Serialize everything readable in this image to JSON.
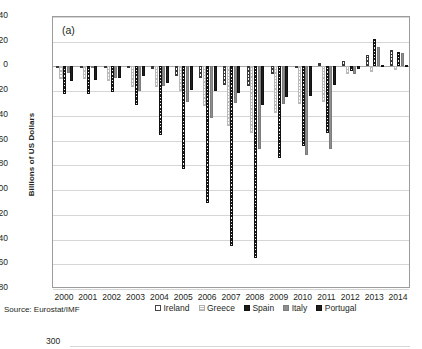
{
  "panel_label": "(a)",
  "axis": {
    "ylabel": "Billions of US Dollars",
    "yticks": [
      "40",
      "20",
      "0",
      "-20",
      "-40",
      "-60",
      "-80",
      "-100",
      "-120",
      "-140",
      "-160",
      "-180"
    ],
    "ymax": 40,
    "ymin": -180
  },
  "source": "Source: Eurostat/IMF",
  "legend": [
    {
      "label": "Ireland",
      "key": "ireland"
    },
    {
      "label": "Greece",
      "key": "greece"
    },
    {
      "label": "Spain",
      "key": "spain"
    },
    {
      "label": "Italy",
      "key": "italy"
    },
    {
      "label": "Portugal",
      "key": "portugal"
    }
  ],
  "next_chart_fragment": "300",
  "colors": {
    "ireland": "#ffffff",
    "greece": "#d9d9d9",
    "spain": "#1a1a1a",
    "italy": "#8e8e8e",
    "portugal": "#1f1f1f",
    "grid": "#d6d6d6",
    "frame": "#9c9c9c",
    "text": "#231f20"
  },
  "chart_data": {
    "type": "bar",
    "title": "(a)",
    "xlabel": "",
    "ylabel": "Billions of US Dollars",
    "ylim": [
      -180,
      40
    ],
    "grid": true,
    "legend_position": "bottom",
    "categories": [
      "2000",
      "2001",
      "2002",
      "2003",
      "2004",
      "2005",
      "2006",
      "2007",
      "2008",
      "2009",
      "2010",
      "2011",
      "2012",
      "2013",
      "2014"
    ],
    "series": [
      {
        "name": "Ireland",
        "values": [
          -1.5,
          -1.0,
          -1.5,
          -1.5,
          -2.0,
          -7.5,
          -9.0,
          -15.0,
          -15.5,
          -6.5,
          -1.5,
          2.5,
          4.5,
          9.5,
          13.0
        ]
      },
      {
        "name": "Greece",
        "values": [
          -10.0,
          -10.5,
          -12.0,
          -16.5,
          -17.0,
          -20.0,
          -32.0,
          -48.0,
          -54.0,
          -38.0,
          -30.0,
          -28.5,
          -6.0,
          -4.5,
          -3.0
        ]
      },
      {
        "name": "Spain",
        "values": [
          -22.0,
          -22.5,
          -21.0,
          -31.5,
          -55.5,
          -83.0,
          -110.5,
          -145.0,
          -155.0,
          -74.0,
          -64.5,
          -53.5,
          -3.5,
          22.0,
          12.0
        ]
      },
      {
        "name": "Italy",
        "values": [
          -5.5,
          -1.0,
          -9.5,
          -19.5,
          -15.5,
          -29.0,
          -41.5,
          -29.5,
          -66.5,
          -30.0,
          -72.0,
          -67.0,
          -6.5,
          16.0,
          11.0
        ]
      },
      {
        "name": "Portugal",
        "values": [
          -11.5,
          -11.0,
          -9.0,
          -8.0,
          -13.5,
          -19.0,
          -19.5,
          -21.5,
          -31.0,
          -25.0,
          -23.5,
          -15.0,
          -2.0,
          1.5,
          1.0
        ]
      }
    ]
  }
}
